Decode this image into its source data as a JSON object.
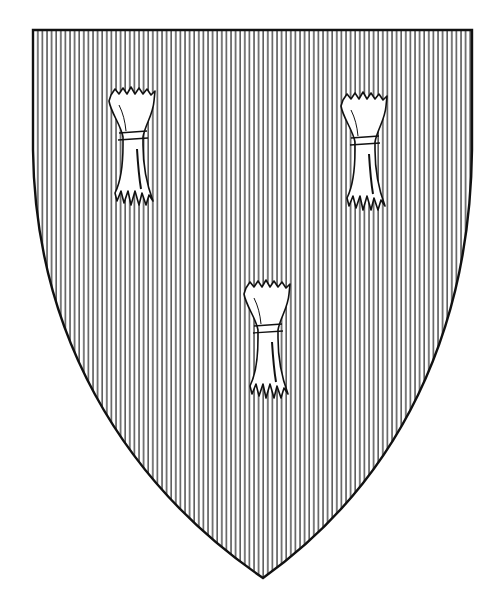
{
  "title": "Shield: gules, three garbs",
  "shield": {
    "field_tincture": "gules (vertical hatching)",
    "charge": "garb",
    "charge_count": 3,
    "arrangement": "two and one",
    "ink_color": "#111111",
    "paper_color": "#ffffff"
  }
}
